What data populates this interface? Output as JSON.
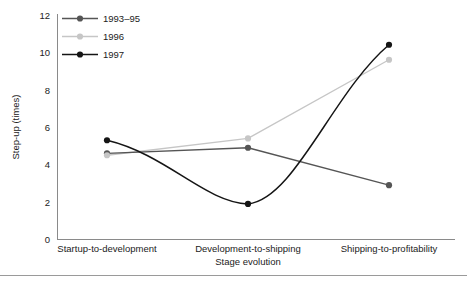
{
  "chart_data": {
    "type": "line",
    "title": "",
    "xlabel": "Stage evolution",
    "ylabel": "Step-up (times)",
    "categories": [
      "Startup-to-development",
      "Development-to-shipping",
      "Shipping-to-profitability"
    ],
    "ylim": [
      0,
      12
    ],
    "yticks": [
      0,
      2,
      4,
      6,
      8,
      10,
      12
    ],
    "ytick_labels": [
      "0",
      "2",
      "4",
      "6",
      "8",
      "10",
      "12"
    ],
    "grid": false,
    "legend_position": "top-left",
    "series": [
      {
        "name": "1993–95",
        "values": [
          4.6,
          4.9,
          2.9
        ],
        "color": "#555555",
        "marker": "circle",
        "smooth": false
      },
      {
        "name": "1996",
        "values": [
          4.5,
          5.4,
          9.6
        ],
        "color": "#c6c6c6",
        "marker": "circle",
        "smooth": false
      },
      {
        "name": "1997",
        "values": [
          5.3,
          1.9,
          10.4
        ],
        "color": "#151515",
        "marker": "circle",
        "smooth": true
      }
    ]
  },
  "axes": {
    "y_title": "Step-up (times)",
    "x_title": "Stage evolution",
    "y_tick_0": "0",
    "y_tick_1": "2",
    "y_tick_2": "4",
    "y_tick_3": "6",
    "y_tick_4": "8",
    "y_tick_5": "10",
    "y_tick_6": "12",
    "cat_0": "Startup-to-development",
    "cat_1": "Development-to-shipping",
    "cat_2": "Shipping-to-profitability"
  },
  "legend": {
    "entries": [
      {
        "label": "1993–95",
        "color": "#555555"
      },
      {
        "label": "1996",
        "color": "#c6c6c6"
      },
      {
        "label": "1997",
        "color": "#151515"
      }
    ],
    "item_0": "1993–95",
    "item_1": "1996",
    "item_2": "1997"
  },
  "colors": {
    "series_1993_95": "#555555",
    "series_1996": "#c6c6c6",
    "series_1997": "#151515",
    "axis": "#8a8a8a",
    "text": "#222222",
    "background": "#ffffff"
  }
}
